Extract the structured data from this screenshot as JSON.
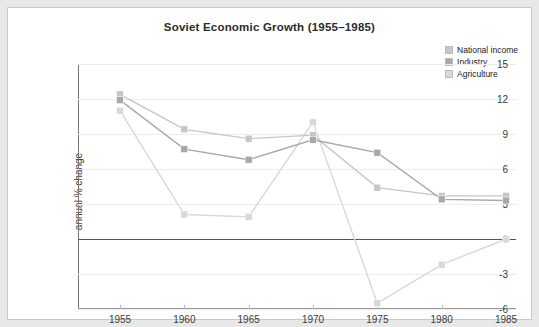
{
  "chart_data": {
    "type": "line",
    "title": "Soviet Economic Growth (1955–1985)",
    "xlabel": "",
    "ylabel": "annual % change",
    "categories": [
      "1955",
      "1960",
      "1965",
      "1970",
      "1975",
      "1980",
      "1985"
    ],
    "x": [
      1955,
      1960,
      1965,
      1970,
      1975,
      1980,
      1985
    ],
    "xlim": [
      1955,
      1985
    ],
    "ylim": [
      -6,
      15
    ],
    "yticks": [
      "15",
      "12",
      "9",
      "6",
      "3",
      "0",
      "-3",
      "-6"
    ],
    "ytick_values": [
      15,
      12,
      9,
      6,
      3,
      0,
      -3,
      -6
    ],
    "grid": true,
    "legend_position": "top-right",
    "series": [
      {
        "name": "National income",
        "color": "#c6c6c6",
        "values": [
          12.4,
          9.4,
          8.6,
          8.9,
          4.4,
          3.7,
          3.7
        ]
      },
      {
        "name": "Industry",
        "color": "#a8a8a8",
        "values": [
          11.9,
          7.7,
          6.8,
          8.5,
          7.4,
          3.4,
          3.3
        ]
      },
      {
        "name": "Agriculture",
        "color": "#d8d8d8",
        "values": [
          11.0,
          2.1,
          1.9,
          10.0,
          -5.5,
          -2.2,
          0.0
        ]
      }
    ]
  },
  "colors": {
    "frame": "#e8e8e8",
    "plate": "#ffffff",
    "gridline": "#ececec",
    "zero_line": "#555555",
    "axis": "#777777",
    "text": "#3a3a3a",
    "title": "#2b2b2b"
  }
}
